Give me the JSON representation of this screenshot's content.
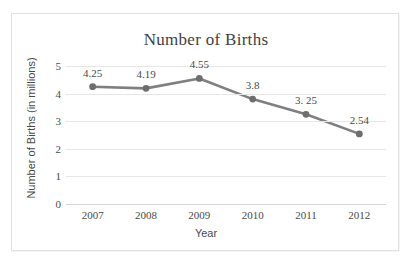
{
  "chart_data": {
    "type": "line",
    "title": "Number of Births",
    "xlabel": "Year",
    "ylabel": "Number of Births (in millions)",
    "categories": [
      "2007",
      "2008",
      "2009",
      "2010",
      "2011",
      "2012"
    ],
    "values": [
      4.25,
      4.19,
      4.55,
      3.8,
      3.25,
      2.54
    ],
    "point_labels": [
      "4.25",
      "4.19",
      "4.55",
      "3.8",
      "3. 25",
      "2.54"
    ],
    "ylim": [
      0,
      5
    ],
    "ytick_labels": [
      "5",
      "4",
      "3",
      "2",
      "1",
      "0"
    ],
    "ytick_values": [
      5,
      4,
      3,
      2,
      1,
      0
    ],
    "grid": true,
    "legend": "none",
    "series": [
      {
        "name": "Number of Births",
        "values": [
          4.25,
          4.19,
          4.55,
          3.8,
          3.25,
          2.54
        ]
      }
    ],
    "colors": {
      "line": "#7f7f7f",
      "marker": "#6e6e6e",
      "gridline": "#e6e6e6",
      "axis": "#d6d6d6",
      "text": "#4a4a4a",
      "title_text": "#3f3f3f",
      "frame_border": "#e2e2e2",
      "background": "#ffffff"
    }
  }
}
